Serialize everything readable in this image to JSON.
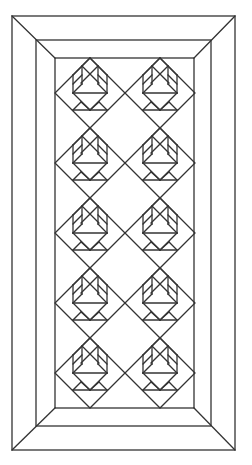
{
  "diagram": {
    "type": "quilt-pattern",
    "stroke_color": "#333333",
    "background": "#ffffff",
    "frames": [
      {
        "name": "outer-border",
        "x1": 12,
        "y1": 16,
        "x2": 235,
        "y2": 450
      },
      {
        "name": "middle-border",
        "x1": 36,
        "y1": 40,
        "x2": 211,
        "y2": 426
      },
      {
        "name": "inner-border",
        "x1": 55,
        "y1": 58,
        "x2": 194,
        "y2": 408
      }
    ],
    "grid": {
      "columns": 2,
      "rows": 5,
      "column_centers": [
        90,
        160
      ],
      "top": 58,
      "block_half_size": 35,
      "row_pitch": 70
    },
    "block_count": 10
  }
}
